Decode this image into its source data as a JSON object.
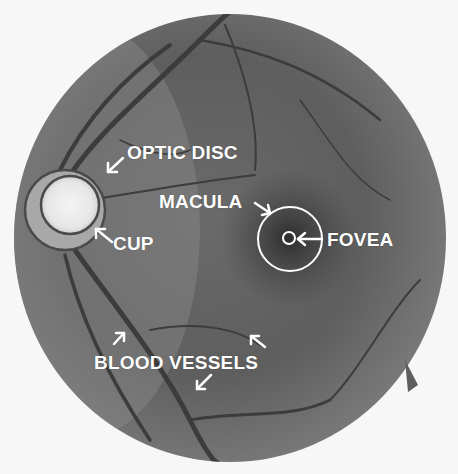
{
  "figure": {
    "background_color": "#f7f7f7",
    "fundus_color": "#6e6e6e",
    "label_color": "#ffffff",
    "ring_color": "#4a4a4a"
  },
  "labels": {
    "optic_disc": "OPTIC DISC",
    "cup": "CUP",
    "macula": "MACULA",
    "fovea": "FOVEA",
    "blood_vessels": "BLOOD VESSELS"
  }
}
